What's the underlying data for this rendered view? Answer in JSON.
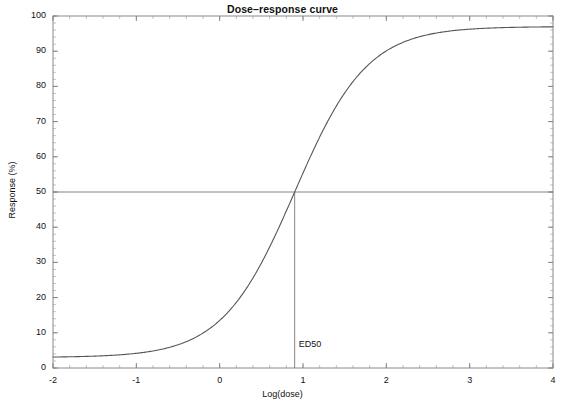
{
  "chart_data": {
    "type": "line",
    "title": "Dose–response curve",
    "xlabel": "Log(dose)",
    "ylabel": "Response (%)",
    "xlim": [
      -2,
      4
    ],
    "ylim": [
      0,
      100
    ],
    "xticks": [
      -2,
      -1,
      0,
      1,
      2,
      3,
      4
    ],
    "xtick_labels": [
      "-2",
      "-1",
      "0",
      "1",
      "2",
      "3",
      "4"
    ],
    "yticks": [
      0,
      10,
      20,
      30,
      40,
      50,
      60,
      70,
      80,
      90,
      100
    ],
    "ytick_labels": [
      "0",
      "10",
      "20",
      "30",
      "40",
      "50",
      "60",
      "70",
      "80",
      "90",
      "100"
    ],
    "x_minor_tick_step": 0.2,
    "y_minor_tick_step": 2,
    "grid": false,
    "legend": null,
    "series": [
      {
        "name": "Dose-response",
        "model": "logistic",
        "bottom": 3.0,
        "top": 97.0,
        "ed50_logdose": 0.9,
        "hill_slope": 1.0,
        "color": "#555555",
        "x": [
          -2.0,
          -1.8,
          -1.6,
          -1.4,
          -1.2,
          -1.0,
          -0.8,
          -0.6,
          -0.4,
          -0.2,
          0.0,
          0.2,
          0.4,
          0.6,
          0.8,
          1.0,
          1.2,
          1.4,
          1.6,
          1.8,
          2.0,
          2.2,
          2.4,
          2.6,
          2.8,
          3.0,
          3.2,
          3.4,
          3.6,
          3.8,
          4.0
        ],
        "y": [
          4.2,
          5.1,
          6.2,
          7.5,
          9.0,
          10.8,
          12.9,
          15.4,
          18.2,
          21.4,
          25.0,
          28.9,
          33.2,
          37.7,
          42.3,
          47.1,
          51.8,
          56.4,
          60.8,
          65.0,
          68.9,
          72.4,
          75.6,
          78.4,
          80.9,
          83.1,
          85.0,
          86.7,
          88.1,
          89.3,
          90.4
        ]
      }
    ],
    "annotations": [
      {
        "name": "ed50-marker",
        "label": "ED50",
        "x": 0.9,
        "y": 50,
        "hline_y": 50,
        "vline_from_y": 0,
        "vline_to_y": 50,
        "line_color": "#777777"
      }
    ],
    "frame": {
      "color": "#888888",
      "background": "#ffffff"
    }
  }
}
